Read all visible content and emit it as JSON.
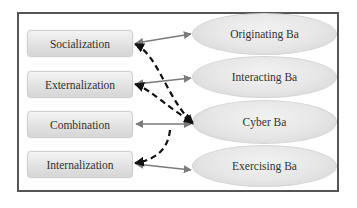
{
  "diagram": {
    "modes": [
      {
        "label": "Socialization"
      },
      {
        "label": "Externalization"
      },
      {
        "label": "Combination"
      },
      {
        "label": "Internalization"
      }
    ],
    "ba": [
      {
        "label": "Originating Ba"
      },
      {
        "label": "Interacting Ba"
      },
      {
        "label": "Cyber Ba"
      },
      {
        "label": "Exercising Ba"
      }
    ],
    "links": [
      {
        "from": "Socialization",
        "to": "Originating Ba",
        "style": "solid",
        "direction": "both"
      },
      {
        "from": "Externalization",
        "to": "Interacting Ba",
        "style": "solid",
        "direction": "both"
      },
      {
        "from": "Combination",
        "to": "Cyber Ba",
        "style": "solid",
        "direction": "both"
      },
      {
        "from": "Internalization",
        "to": "Exercising Ba",
        "style": "solid",
        "direction": "both"
      },
      {
        "from": "Cyber Ba",
        "to": "Socialization",
        "style": "dashed",
        "direction": "both"
      },
      {
        "from": "Cyber Ba",
        "to": "Externalization",
        "style": "dashed",
        "direction": "both"
      },
      {
        "from": "Cyber Ba",
        "to": "Internalization",
        "style": "dashed",
        "direction": "forward"
      }
    ],
    "colors": {
      "solid_arrow": "#7a7a7a",
      "dashed_arrow": "#111111",
      "frame": "#555555",
      "text": "#333333"
    }
  }
}
